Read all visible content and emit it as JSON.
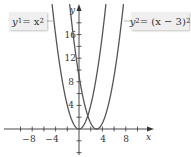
{
  "chart_data": {
    "type": "line",
    "title": "",
    "xlabel": "x",
    "ylabel": "y",
    "xlim": [
      -13,
      17
    ],
    "ylim": [
      -5,
      19
    ],
    "x_ticks": [
      -10,
      -8,
      -6,
      -4,
      -2,
      2,
      4,
      6,
      8,
      10
    ],
    "x_tick_labels": [
      "-8",
      "-4",
      "4",
      "8"
    ],
    "y_ticks": [
      -4,
      -2,
      2,
      4,
      6,
      8,
      10,
      12,
      14,
      16,
      18
    ],
    "y_tick_labels": [
      "4",
      "8",
      "12",
      "16"
    ],
    "grid": false,
    "series": [
      {
        "name": "y1 = x^2",
        "expression": "x^2",
        "shift": 0,
        "color": "#555555"
      },
      {
        "name": "y2 = (x - 3)^2",
        "expression": "(x - 3)^2",
        "shift": 3,
        "color": "#555555"
      }
    ],
    "annotations": [
      {
        "text": "y1 = x^2",
        "series": 0,
        "position": "top-left"
      },
      {
        "text": "y2 = (x - 3)^2",
        "series": 1,
        "position": "top-right"
      }
    ]
  },
  "labels": {
    "y1_name": "y",
    "y1_sub": "1",
    "y1_rhs": " = x",
    "y1_exp": "2",
    "y2_name": "y",
    "y2_sub": "2",
    "y2_rhs": " = (x − 3)",
    "y2_exp": "2",
    "x_axis": "x",
    "y_axis": "y",
    "tick_neg8": "−8",
    "tick_neg4": "−4",
    "tick_4x": "4",
    "tick_8x": "8",
    "tick_4y": "4",
    "tick_8y": "8",
    "tick_12y": "12",
    "tick_16y": "16"
  }
}
